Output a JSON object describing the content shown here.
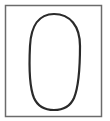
{
  "figure": {
    "background": "#ffffff",
    "frame": {
      "x": 5.5,
      "y": 5.5,
      "width": 96,
      "height": 111,
      "stroke": "#6b6b6b",
      "stroke_width": 1.5
    },
    "shape": {
      "kind": "egg-oval",
      "stroke": "#2a2a2a",
      "stroke_width": 2.2,
      "fill": "none"
    }
  }
}
